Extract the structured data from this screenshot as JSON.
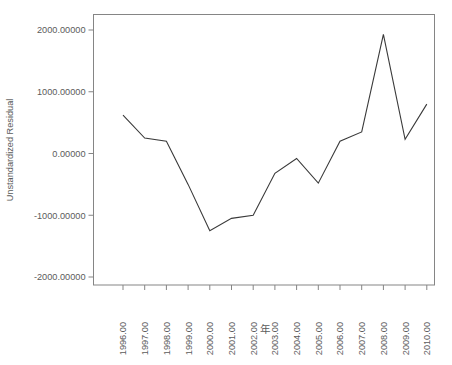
{
  "chart_data": {
    "type": "line",
    "title": "",
    "xlabel": "年",
    "ylabel": "Unstandardized Residual",
    "x": [
      1996,
      1997,
      1998,
      1999,
      2000,
      2001,
      2002,
      2003,
      2004,
      2005,
      2006,
      2007,
      2008,
      2009,
      2010
    ],
    "categories": [
      "1996.00",
      "1997.00",
      "1998.00",
      "1999.00",
      "2000.00",
      "2001.00",
      "2002.00",
      "2003.00",
      "2004.00",
      "2005.00",
      "2006.00",
      "2007.00",
      "2008.00",
      "2009.00",
      "2010.00"
    ],
    "values": [
      620,
      250,
      200,
      -500,
      -1250,
      -1050,
      -1000,
      -320,
      -80,
      -480,
      200,
      350,
      1930,
      230,
      800
    ],
    "series": [
      {
        "name": "Unstandardized Residual",
        "values": [
          620,
          250,
          200,
          -500,
          -1250,
          -1050,
          -1000,
          -320,
          -80,
          -480,
          200,
          350,
          1930,
          230,
          800
        ]
      }
    ],
    "ylim": [
      -2000,
      2000
    ],
    "xlim": [
      1995.5,
      2010.5
    ],
    "ytick_values": [
      2000,
      1000,
      0,
      -1000,
      -2000
    ],
    "ytick_labels": [
      "2000.00000",
      "1000.00000",
      "0.00000",
      "-1000.00000",
      "-2000.00000"
    ],
    "xtick_labels": [
      "1996.00",
      "1997.00",
      "1998.00",
      "1999.00",
      "2000.00",
      "2001.00",
      "2002.00",
      "2003.00",
      "2004.00",
      "2005.00",
      "2006.00",
      "2007.00",
      "2008.00",
      "2009.00",
      "2010.00"
    ],
    "grid": false,
    "legend": false,
    "line_color": "#3a3a3a",
    "axis_color": "#858585",
    "background_color": "#ffffff"
  }
}
